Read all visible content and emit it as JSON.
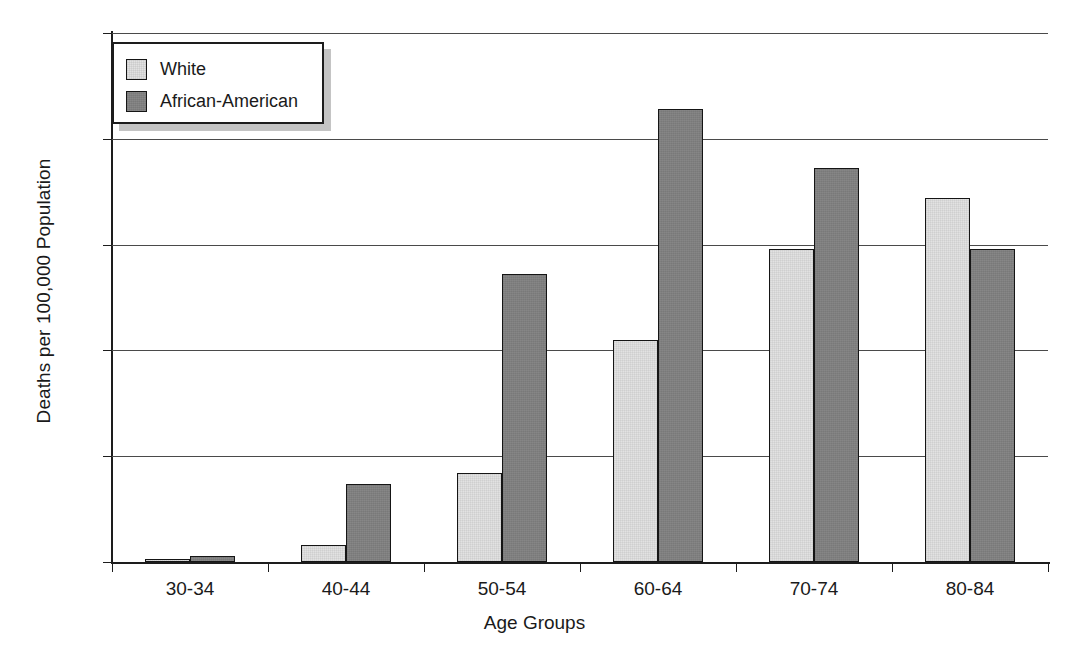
{
  "chart_data": {
    "type": "bar",
    "title": "",
    "xlabel": "Age Groups",
    "ylabel": "Deaths per 100,000 Population",
    "categories": [
      "30-34",
      "40-44",
      "50-54",
      "60-64",
      "70-74",
      "80-84"
    ],
    "series": [
      {
        "name": "White",
        "color": "#e2e2e2",
        "values": [
          0.15,
          0.8,
          4.2,
          10.5,
          14.8,
          17.2
        ]
      },
      {
        "name": "African-American",
        "color": "#7f7f7f",
        "values": [
          0.3,
          3.7,
          13.6,
          21.4,
          18.6,
          14.8
        ]
      }
    ],
    "ylim": [
      0,
      25
    ],
    "yticks": [
      0,
      5,
      10,
      15,
      20,
      25
    ],
    "ytick_labels": [
      "0",
      "5",
      "10",
      "15",
      "20",
      "25"
    ],
    "grid": "horizontal",
    "legend_position": "top-left",
    "bar_style": "grouped-adjacent"
  }
}
